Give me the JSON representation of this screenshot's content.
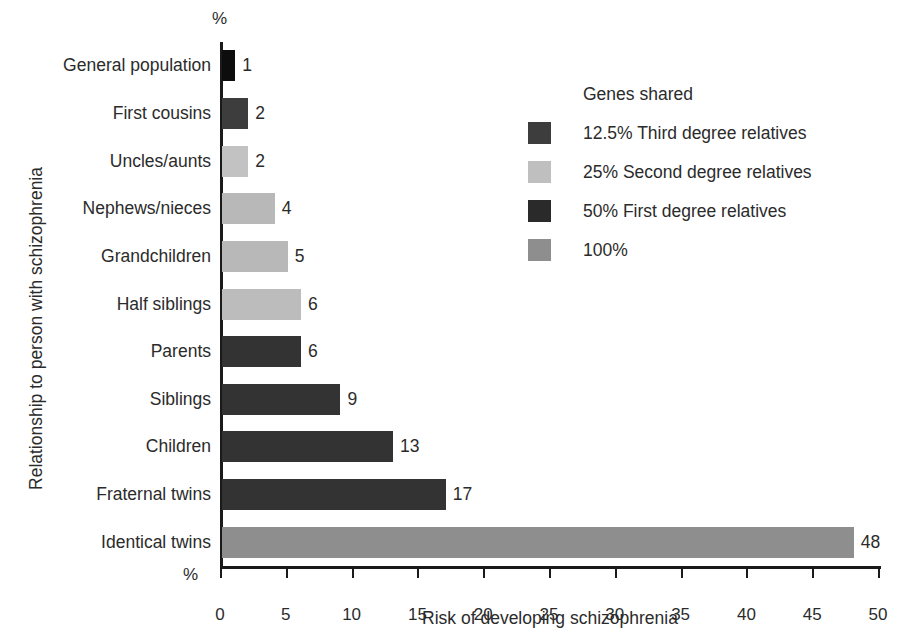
{
  "chart_data": {
    "type": "bar",
    "orientation": "horizontal",
    "title": "",
    "xlabel": "Risk of developing schizophrenia",
    "ylabel": "Relationship to person with schizophrenia",
    "x_unit_label": "%",
    "y_unit_label": "%",
    "xlim": [
      0,
      50
    ],
    "xticks": [
      0,
      5,
      10,
      15,
      20,
      25,
      30,
      35,
      40,
      45,
      50
    ],
    "grid": false,
    "categories": [
      "General population",
      "First cousins",
      "Uncles/aunts",
      "Nephews/nieces",
      "Grandchildren",
      "Half siblings",
      "Parents",
      "Siblings",
      "Children",
      "Fraternal twins",
      "Identical twins"
    ],
    "values": [
      1,
      2,
      2,
      4,
      5,
      6,
      6,
      9,
      13,
      17,
      48
    ],
    "value_labels": [
      "1",
      "2",
      "2",
      "4",
      "5",
      "6",
      "6",
      "9",
      "13",
      "17",
      "48"
    ],
    "bar_group": [
      "general",
      "third",
      "second",
      "second",
      "second",
      "second",
      "first",
      "first",
      "first",
      "first",
      "identical"
    ],
    "bar_colors": [
      "#0d0d0d",
      "#3d3d3d",
      "#c2c2c2",
      "#b8b8b8",
      "#b8b8b8",
      "#bcbcbc",
      "#333333",
      "#333333",
      "#333333",
      "#333333",
      "#8e8e8e"
    ],
    "legend": {
      "position": "upper-right",
      "title": "Genes shared",
      "entries": [
        {
          "label": "12.5% Third degree relatives",
          "color": "#3d3d3d"
        },
        {
          "label": "25% Second degree relatives",
          "color": "#bfbfbf"
        },
        {
          "label": "50% First degree relatives",
          "color": "#2a2a2a"
        },
        {
          "label": "100%",
          "color": "#8e8e8e"
        }
      ]
    }
  }
}
